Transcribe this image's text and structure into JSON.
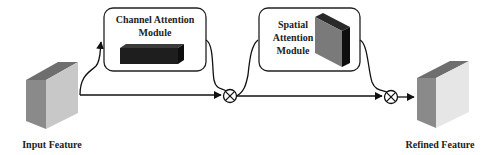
{
  "diagram": {
    "input_label": "Input Feature",
    "output_label": "Refined Feature",
    "channel_module": {
      "line1": "Channel Attention",
      "line2": "Module"
    },
    "spatial_module": {
      "line1": "Spatial",
      "line2": "Attention",
      "line3": "Module"
    },
    "operators": [
      {
        "symbol": "element-wise multiplication",
        "glyph": "⊗"
      },
      {
        "symbol": "element-wise multiplication",
        "glyph": "⊗"
      }
    ],
    "colors": {
      "line": "#111111",
      "box_border": "#222222",
      "cube_front_input": "#c8c8c8",
      "cube_side_input": "#8a8a8a",
      "cube_top_input": "#6e6e6e",
      "cube_front_output": "#e6e6e6",
      "channel_block": "#1e1e1e",
      "spatial_block_front": "#7a7a7a",
      "spatial_block_side": "#111111"
    }
  }
}
